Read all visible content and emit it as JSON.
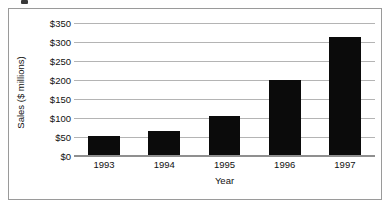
{
  "chart_data": {
    "type": "bar",
    "title": "",
    "xlabel": "Year",
    "ylabel": "Sales ($ millions)",
    "categories": [
      "1993",
      "1994",
      "1995",
      "1996",
      "1997"
    ],
    "values": [
      52,
      65,
      104,
      200,
      313
    ],
    "ylim": [
      0,
      350
    ],
    "ytick_values": [
      0,
      50,
      100,
      150,
      200,
      250,
      300,
      350
    ],
    "ytick_labels": [
      "$0",
      "$50",
      "$100",
      "$150",
      "$200",
      "$250",
      "$300",
      "$350"
    ],
    "grid": "horizontal",
    "legend": "none",
    "bar_color": "#0b0b0b",
    "gridline_color": "#b4b4b4",
    "frame_color": "#9a9a9a",
    "background_color": "#ffffff"
  }
}
